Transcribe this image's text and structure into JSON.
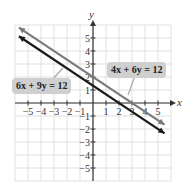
{
  "chart_data": {
    "type": "line",
    "title": "",
    "xlabel": "x",
    "ylabel": "y",
    "xlim": [
      -6,
      6
    ],
    "ylim": [
      -6,
      6
    ],
    "grid": true,
    "x_ticks": [
      -5,
      -4,
      -3,
      -2,
      -1,
      1,
      2,
      3,
      4,
      5
    ],
    "y_ticks": [
      5,
      4,
      3,
      2,
      1,
      -1,
      -2,
      -3,
      -4,
      -5
    ],
    "series": [
      {
        "name": "4x + 6y = 12",
        "equation": "y = 2 - (2/3)x",
        "color": "#7a7a7a",
        "x": [
          -5.7,
          5.5
        ],
        "y": [
          5.8,
          -1.667
        ]
      },
      {
        "name": "6x + 9y = 12",
        "equation": "y = 4/3 - (2/3)x",
        "color": "#1a1a1a",
        "x": [
          -5.7,
          5.5
        ],
        "y": [
          5.133,
          -2.333
        ]
      }
    ],
    "annotations": [
      {
        "text": "6x + 9y = 12",
        "points_to": "6x + 9y = 12"
      },
      {
        "text": "4x + 6y = 12",
        "points_to": "4x + 6y = 12"
      }
    ]
  },
  "labels": {
    "eq1": "6x + 9y = 12",
    "eq2": "4x + 6y = 12",
    "x_axis": "x",
    "y_axis": "y"
  },
  "colors": {
    "grid": "#d9d9d9",
    "axis": "#333333",
    "line_gray": "#7a7a7a",
    "line_black": "#1a1a1a",
    "label_bg": "#cfcfcf"
  }
}
